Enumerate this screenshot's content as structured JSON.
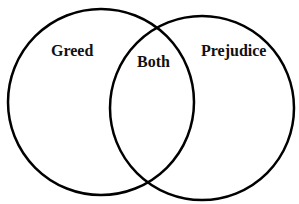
{
  "diagram": {
    "type": "venn",
    "sets": [
      {
        "label": "Greed"
      },
      {
        "label": "Prejudice"
      }
    ],
    "intersection_label": "Both",
    "stroke_color": "#000000",
    "background": "#ffffff"
  }
}
